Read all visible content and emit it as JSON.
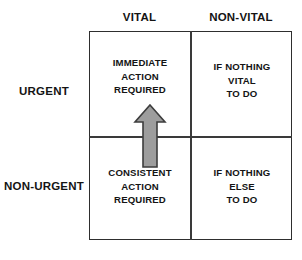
{
  "diagram": {
    "type": "2x2-priority-matrix",
    "column_headers": [
      {
        "id": "vital",
        "label": "VITAL"
      },
      {
        "id": "non-vital",
        "label": "NON-VITAL"
      }
    ],
    "row_headers": [
      {
        "id": "urgent",
        "label": "URGENT"
      },
      {
        "id": "non-urgent",
        "label": "NON-URGENT"
      }
    ],
    "quadrants": [
      {
        "id": "urgent-vital",
        "row": "URGENT",
        "column": "VITAL",
        "lines": [
          "IMMEDIATE",
          "ACTION",
          "REQUIRED"
        ]
      },
      {
        "id": "urgent-nonvital",
        "row": "URGENT",
        "column": "NON-VITAL",
        "lines": [
          "IF NOTHING",
          "VITAL",
          "TO DO"
        ]
      },
      {
        "id": "nonurgent-vital",
        "row": "NON-URGENT",
        "column": "VITAL",
        "lines": [
          "CONSISTENT",
          "ACTION",
          "REQUIRED"
        ]
      },
      {
        "id": "nonurgent-nonvital",
        "row": "NON-URGENT",
        "column": "NON-VITAL",
        "lines": [
          "IF NOTHING",
          "ELSE",
          "TO DO"
        ]
      }
    ],
    "annotations": [
      {
        "id": "escalation-arrow",
        "icon": "up-arrow-icon",
        "direction": "up",
        "from_quadrant": "nonurgent-vital",
        "to_quadrant": "urgent-vital",
        "fill_color": "#9d9d9d",
        "stroke_color": "#3d3d3d"
      }
    ],
    "colors": {
      "background": "#ffffff",
      "frame_stroke": "#2e2e2e",
      "divider_stroke": "#3a3a3a",
      "text": "#141414",
      "arrow_fill": "#9d9d9d",
      "arrow_stroke": "#3d3d3d"
    }
  }
}
